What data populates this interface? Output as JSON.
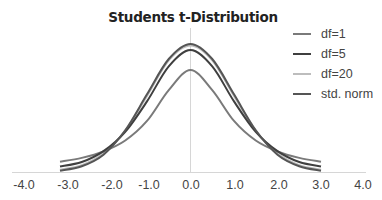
{
  "chart_data": {
    "type": "line",
    "title": "Students t-Distribution",
    "xlabel": "",
    "ylabel": "",
    "xlim": [
      -4.0,
      4.0
    ],
    "ylim": [
      0,
      0.4
    ],
    "grid": false,
    "legend_position": "top-right",
    "x_ticks": [
      "-4.0",
      "-3.0",
      "-2.0",
      "-1.0",
      "0.0",
      "1.0",
      "2.0",
      "3.0",
      "4.0"
    ],
    "x": [
      -3.0,
      -2.5,
      -2.0,
      -1.5,
      -1.0,
      -0.5,
      0.0,
      0.5,
      1.0,
      1.5,
      2.0,
      2.5,
      3.0
    ],
    "series": [
      {
        "name": "df=1",
        "color": "#7a7a7a",
        "values": [
          0.032,
          0.044,
          0.064,
          0.098,
          0.159,
          0.255,
          0.318,
          0.255,
          0.159,
          0.098,
          0.064,
          0.044,
          0.032
        ]
      },
      {
        "name": "df=5",
        "color": "#3f3f3f",
        "values": [
          0.017,
          0.031,
          0.065,
          0.125,
          0.22,
          0.329,
          0.38,
          0.329,
          0.22,
          0.125,
          0.065,
          0.031,
          0.017
        ]
      },
      {
        "name": "df=20",
        "color": "#bdbdbd",
        "values": [
          0.007,
          0.021,
          0.058,
          0.129,
          0.237,
          0.348,
          0.394,
          0.348,
          0.237,
          0.129,
          0.058,
          0.021,
          0.007
        ]
      },
      {
        "name": "std. norm",
        "color": "#555555",
        "values": [
          0.004,
          0.018,
          0.054,
          0.13,
          0.242,
          0.352,
          0.399,
          0.352,
          0.242,
          0.13,
          0.054,
          0.018,
          0.004
        ]
      }
    ]
  },
  "legend": [
    {
      "label": "df=1",
      "color": "#7a7a7a"
    },
    {
      "label": "df=5",
      "color": "#3f3f3f"
    },
    {
      "label": "df=20",
      "color": "#bdbdbd"
    },
    {
      "label": "std. norm",
      "color": "#555555"
    }
  ],
  "axis": {
    "x_tick_labels": [
      "-4.0",
      "-3.0",
      "-2.0",
      "-1.0",
      "0.0",
      "1.0",
      "2.0",
      "3.0",
      "4.0"
    ]
  }
}
